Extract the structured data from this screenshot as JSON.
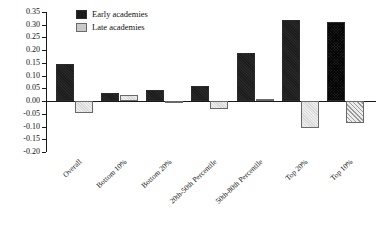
{
  "chart_data": {
    "type": "bar",
    "title": "",
    "subtitle": "",
    "xlabel": "",
    "ylabel": "",
    "ylim": [
      -0.2,
      0.35
    ],
    "grid": false,
    "legend_position": "top-left",
    "y_ticks": [
      "0.35",
      "0.30",
      "0.25",
      "0.20",
      "0.15",
      "0.10",
      "0.05",
      "0.00",
      "-0.05",
      "-0.10",
      "-0.15",
      "-0.20"
    ],
    "y_tick_values": [
      0.35,
      0.3,
      0.25,
      0.2,
      0.15,
      0.1,
      0.05,
      0.0,
      -0.05,
      -0.1,
      -0.15,
      -0.2
    ],
    "categories": [
      "Overall",
      "Bottom 10%",
      "Bottom 20%",
      "20th-50th Percentile",
      "50th-80th Percentile",
      "Top 20%",
      "Top 10%"
    ],
    "series": [
      {
        "name": "Early academies",
        "values": [
          0.145,
          0.03,
          0.045,
          0.06,
          0.19,
          0.32,
          0.31
        ]
      },
      {
        "name": "Late academies",
        "values": [
          -0.045,
          0.025,
          -0.005,
          -0.03,
          0.008,
          -0.105,
          -0.085
        ]
      }
    ]
  },
  "legend": {
    "items": [
      {
        "label": "Early academies",
        "swatch": "dark-solid-swatch"
      },
      {
        "label": "Late academies",
        "swatch": "light-shaded-swatch"
      }
    ]
  },
  "colors": {
    "early": "#1c1c1c",
    "late": "#d8d8d8",
    "axis": "#1a1a1a",
    "text": "#111111",
    "background": "#ffffff"
  }
}
